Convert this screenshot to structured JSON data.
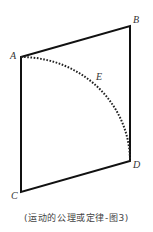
{
  "diagram": {
    "points": {
      "A": {
        "label": "A",
        "x": 21,
        "y": 57
      },
      "B": {
        "label": "B",
        "x": 130,
        "y": 26
      },
      "C": {
        "label": "C",
        "x": 21,
        "y": 192
      },
      "D": {
        "label": "D",
        "x": 130,
        "y": 161
      },
      "E": {
        "label": "E"
      }
    },
    "shape": "quadrilateral A-B-D-C",
    "curve": "dotted arc from A through E to D",
    "stroke_color": "#111111"
  },
  "caption": "(运动的公理或定律-图3)"
}
